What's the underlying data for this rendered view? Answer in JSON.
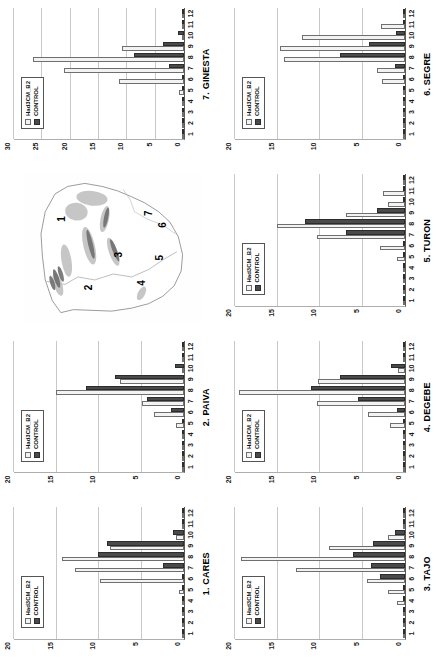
{
  "figure": {
    "legend": {
      "series_b2": "Had3CM_B2",
      "series_control": "CONTROL"
    },
    "map": {
      "name": "iberian-peninsula-basin-map",
      "site_labels": [
        "1",
        "2",
        "3",
        "4",
        "5",
        "6",
        "7"
      ]
    }
  },
  "chart_data": [
    {
      "type": "bar",
      "title": "1. CARES",
      "xlabel": "",
      "ylabel": "",
      "ylim": [
        0,
        20
      ],
      "yticks": [
        0,
        5,
        10,
        15,
        20
      ],
      "grid": true,
      "legend_position": "upper-left",
      "categories": [
        "1",
        "2",
        "3",
        "4",
        "5",
        "6",
        "7",
        "8",
        "9",
        "10",
        "11",
        "12"
      ],
      "series": [
        {
          "name": "Had3CM_B2",
          "values": [
            0,
            0,
            0,
            0,
            0.6,
            9.9,
            12.8,
            14.4,
            8.7,
            1.0,
            0,
            0
          ]
        },
        {
          "name": "CONTROL",
          "values": [
            0,
            0,
            0,
            0,
            0,
            0,
            2.5,
            10.1,
            9.1,
            1.3,
            0,
            0
          ]
        }
      ]
    },
    {
      "type": "bar",
      "title": "2. PAIVA",
      "xlabel": "",
      "ylabel": "",
      "ylim": [
        0,
        20
      ],
      "yticks": [
        0,
        5,
        10,
        15,
        20
      ],
      "grid": true,
      "legend_position": "upper-left",
      "categories": [
        "1",
        "2",
        "3",
        "4",
        "5",
        "6",
        "7",
        "8",
        "9",
        "10",
        "11",
        "12"
      ],
      "series": [
        {
          "name": "Had3CM_B2",
          "values": [
            0,
            0,
            0,
            0,
            0.9,
            3.5,
            5.0,
            15.1,
            7.5,
            0,
            0,
            0
          ]
        },
        {
          "name": "CONTROL",
          "values": [
            0,
            0,
            0,
            0,
            0,
            1.5,
            4.4,
            11.5,
            8.1,
            1.1,
            0,
            0
          ]
        }
      ]
    },
    {
      "type": "bar",
      "title": "3. TAJO",
      "xlabel": "",
      "ylabel": "",
      "ylim": [
        0,
        20
      ],
      "yticks": [
        0,
        5,
        10,
        15,
        20
      ],
      "grid": true,
      "legend_position": "upper-left",
      "categories": [
        "1",
        "2",
        "3",
        "4",
        "5",
        "6",
        "7",
        "8",
        "9",
        "10",
        "11",
        "12"
      ],
      "series": [
        {
          "name": "Had3CM_B2",
          "values": [
            0,
            0,
            0,
            1.0,
            2.0,
            4.5,
            12.8,
            19.3,
            9.0,
            2.0,
            0,
            0
          ]
        },
        {
          "name": "CONTROL",
          "values": [
            0,
            0,
            0,
            0,
            0,
            3.0,
            4.0,
            6.1,
            3.8,
            1.2,
            0,
            0
          ]
        }
      ]
    },
    {
      "type": "bar",
      "title": "4. DEGEBE",
      "xlabel": "",
      "ylabel": "",
      "ylim": [
        0,
        20
      ],
      "yticks": [
        0,
        5,
        10,
        15,
        20
      ],
      "grid": true,
      "legend_position": "upper-left",
      "categories": [
        "1",
        "2",
        "3",
        "4",
        "5",
        "6",
        "7",
        "8",
        "9",
        "10",
        "11",
        "12"
      ],
      "series": [
        {
          "name": "Had3CM_B2",
          "values": [
            0,
            0,
            0,
            0,
            1.8,
            4.4,
            10.4,
            19.5,
            10.2,
            0.8,
            0,
            0
          ]
        },
        {
          "name": "CONTROL",
          "values": [
            0,
            0,
            0,
            0,
            0,
            1.0,
            5.5,
            11.1,
            7.6,
            1.6,
            0,
            0
          ]
        }
      ]
    },
    {
      "type": "bar",
      "title": "5. TURON",
      "xlabel": "",
      "ylabel": "",
      "ylim": [
        0,
        20
      ],
      "yticks": [
        0,
        5,
        10,
        15,
        20
      ],
      "grid": true,
      "legend_position": "upper-left",
      "categories": [
        "1",
        "2",
        "3",
        "4",
        "5",
        "6",
        "7",
        "8",
        "9",
        "10",
        "11",
        "12"
      ],
      "series": [
        {
          "name": "Had3CM_B2",
          "values": [
            0,
            0,
            0,
            0,
            0.9,
            3.0,
            10.3,
            15.1,
            7.0,
            2.0,
            2.6,
            0
          ]
        },
        {
          "name": "CONTROL",
          "values": [
            0,
            0,
            0,
            0,
            0,
            0,
            7.0,
            11.8,
            3.3,
            0,
            0,
            0
          ]
        }
      ]
    },
    {
      "type": "bar",
      "title": "6. SEGRE",
      "xlabel": "",
      "ylabel": "",
      "ylim": [
        0,
        20
      ],
      "yticks": [
        0,
        5,
        10,
        15,
        20
      ],
      "grid": true,
      "legend_position": "upper-left",
      "categories": [
        "1",
        "2",
        "3",
        "4",
        "5",
        "6",
        "7",
        "8",
        "9",
        "10",
        "11",
        "12"
      ],
      "series": [
        {
          "name": "Had3CM_B2",
          "values": [
            0,
            0,
            0,
            0,
            0,
            2.7,
            3.3,
            14.2,
            14.7,
            12.1,
            2.8,
            0
          ]
        },
        {
          "name": "CONTROL",
          "values": [
            0,
            0,
            0,
            0,
            0,
            0,
            1.2,
            7.6,
            4.2,
            1.1,
            0,
            0
          ]
        }
      ]
    },
    {
      "type": "bar",
      "title": "7. GINESTA",
      "xlabel": "",
      "ylabel": "",
      "ylim": [
        0,
        30
      ],
      "yticks": [
        0,
        5,
        10,
        15,
        20,
        25,
        30
      ],
      "grid": true,
      "legend_position": "upper-left",
      "categories": [
        "1",
        "2",
        "3",
        "4",
        "5",
        "6",
        "7",
        "8",
        "9",
        "10",
        "11",
        "12"
      ],
      "series": [
        {
          "name": "Had3CM_B2",
          "values": [
            0,
            0,
            0,
            0,
            0.8,
            11.4,
            21.1,
            26.6,
            11.0,
            0,
            0,
            0
          ]
        },
        {
          "name": "CONTROL",
          "values": [
            0,
            0,
            0,
            0,
            0,
            0,
            2.6,
            8.8,
            3.7,
            1.0,
            0,
            0
          ]
        }
      ]
    }
  ]
}
